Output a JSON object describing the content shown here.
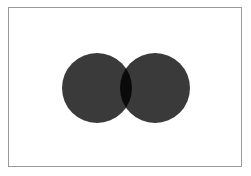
{
  "diagram": {
    "type": "venn",
    "sets": [
      {
        "id": "left-set",
        "color": "#3a3a3a"
      },
      {
        "id": "right-set",
        "color": "#3a3a3a"
      }
    ],
    "intersection": {
      "color": "#0a0a0a"
    },
    "frame_color": "#9a9a9a",
    "background": "#ffffff"
  }
}
